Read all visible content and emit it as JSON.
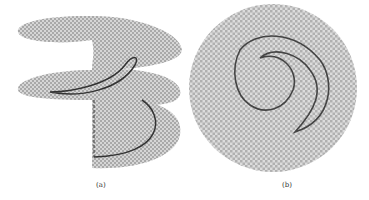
{
  "figure": {
    "panels": [
      {
        "id": "a",
        "caption": "(a)",
        "description": "Helical (spiral staircase) surface with checkerboard texture, two full turns, with a dark closed curve on upper sheet and arc on lower sheet, dashed vertical line"
      },
      {
        "id": "b",
        "caption": "(b)",
        "description": "Top-down projection: disk with checkerboard polar texture and a dark closed crescent-shaped curve"
      }
    ],
    "colors": {
      "texture_light": "#e8e8e8",
      "texture_dark": "#a8a8a8",
      "curve": "#333333",
      "background": "#ffffff"
    }
  }
}
